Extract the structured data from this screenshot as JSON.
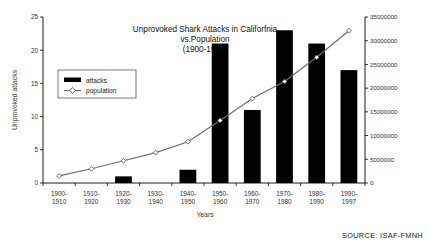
{
  "chart_data": {
    "type": "bar",
    "title": "Unprovoked Shark Attacks in Califorfnia vs.Population (1900-1997)",
    "title_lines": [
      "Unprovoked Shark Attacks in Califorfnia",
      "vs.Population",
      "(1900-1997)"
    ],
    "xlabel": "Years",
    "ylabel": "Unprovoked attacks",
    "y2label": "",
    "categories": [
      "1900-1910",
      "1910-1920",
      "1920-1930",
      "1930-1940",
      "1940-1950",
      "1950-1960",
      "1960-1970",
      "1970-1980",
      "1980-1990",
      "1990-1997"
    ],
    "category_lines": [
      [
        "1900-",
        "1910"
      ],
      [
        "1910-",
        "1920"
      ],
      [
        "1920-",
        "1930"
      ],
      [
        "1930-",
        "1940"
      ],
      [
        "1940-",
        "1950"
      ],
      [
        "1950-",
        "1960"
      ],
      [
        "1960-",
        "1970"
      ],
      [
        "1970-",
        "1980"
      ],
      [
        "1980-",
        "1990"
      ],
      [
        "1990-",
        "1997"
      ]
    ],
    "series": [
      {
        "name": "attacks",
        "axis": "left",
        "type": "bar",
        "color": "#000000",
        "values": [
          0,
          0,
          1,
          0,
          2,
          21,
          11,
          23,
          21,
          17
        ]
      },
      {
        "name": "population",
        "axis": "right",
        "type": "line",
        "color": "#6e6e6e",
        "marker": "open-diamond",
        "values": [
          1500000,
          3000000,
          4700000,
          6400000,
          8700000,
          13200000,
          17800000,
          21400000,
          26500000,
          32100000
        ]
      }
    ],
    "ylim": [
      0,
      25
    ],
    "yticks": [
      0,
      5,
      10,
      15,
      20,
      25
    ],
    "ytick_labels": [
      "0",
      "5",
      "10",
      "15",
      "20",
      "25"
    ],
    "y2lim": [
      0,
      35000000
    ],
    "y2ticks": [
      0,
      5000000,
      10000000,
      15000000,
      20000000,
      25000000,
      30000000,
      35000000
    ],
    "y2tick_labels": [
      "0",
      "5000000",
      "10000000",
      "15000000",
      "20000000",
      "25000000",
      "30000000",
      "35000000"
    ],
    "grid": false,
    "legend_position": "upper-left-inside",
    "legend_entries": [
      "attacks",
      "population"
    ]
  },
  "source_note": "SOURCE: ISAF-FMNH"
}
